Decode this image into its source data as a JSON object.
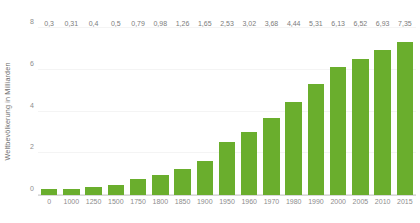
{
  "chart_data": {
    "type": "bar",
    "title": "",
    "subtitle": "",
    "xlabel": "",
    "ylabel": "Weltbevölkerung in Milliarden",
    "ylim": [
      0,
      8
    ],
    "yticks": [
      "0",
      "2",
      "4",
      "6",
      "8"
    ],
    "ytick_values": [
      0,
      2,
      4,
      6,
      8
    ],
    "grid": true,
    "legend": null,
    "legend_position": "none",
    "bar_color": "#6aae2d",
    "label_color": "#7c7c7c",
    "axis_color": "#8d8d8d",
    "gridline_color": "#f4f4f4",
    "background": "#ffffff",
    "decimal_separator": ",",
    "categories": [
      "0",
      "1000",
      "1250",
      "1500",
      "1750",
      "1800",
      "1850",
      "1900",
      "1950",
      "1960",
      "1970",
      "1980",
      "1990",
      "2000",
      "2005",
      "2010",
      "2015"
    ],
    "values": [
      0.3,
      0.31,
      0.4,
      0.5,
      0.79,
      0.98,
      1.26,
      1.65,
      2.53,
      3.02,
      3.68,
      4.44,
      5.31,
      6.13,
      6.52,
      6.93,
      7.35
    ],
    "value_labels": [
      "0,3",
      "0,31",
      "0,4",
      "0,5",
      "0,79",
      "0,98",
      "1,26",
      "1,65",
      "2,53",
      "3,02",
      "3,68",
      "4,44",
      "5,31",
      "6,13",
      "6,52",
      "6,93",
      "7,35"
    ]
  }
}
